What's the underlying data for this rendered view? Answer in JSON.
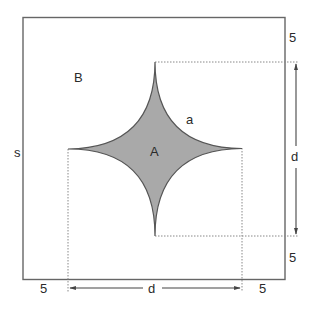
{
  "colors": {
    "stroke": "#555555",
    "fill": "#a9a9a9",
    "dotted": "#777777",
    "text": "#2a2a2a"
  },
  "labels": {
    "region_outer": "B",
    "region_inner": "A",
    "arc": "a",
    "side": "s",
    "dimension_vertical": "d",
    "dimension_horizontal": "d",
    "margin_top_right": "5",
    "margin_bottom_right": "5",
    "margin_bottom_left": "5",
    "margin_bottom_right_lower": "5"
  }
}
